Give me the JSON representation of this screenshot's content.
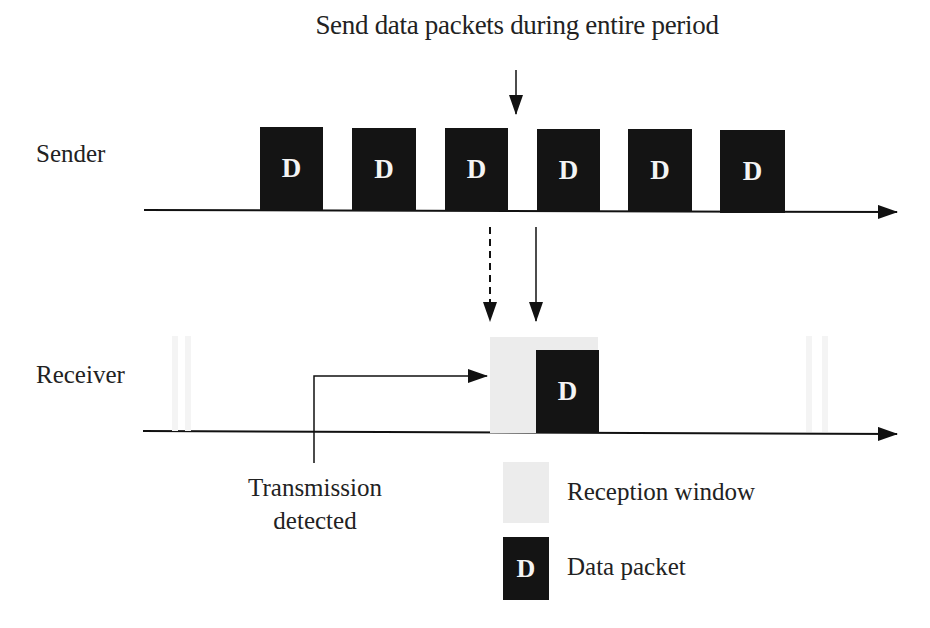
{
  "title": "Send data packets during entire period",
  "lanes": {
    "sender": {
      "label": "Sender"
    },
    "receiver": {
      "label": "Receiver"
    }
  },
  "packet_glyph": "D",
  "sender_packets": [
    {
      "label": "D"
    },
    {
      "label": "D"
    },
    {
      "label": "D"
    },
    {
      "label": "D"
    },
    {
      "label": "D"
    },
    {
      "label": "D"
    }
  ],
  "receiver_packet": {
    "label": "D"
  },
  "annotations": {
    "transmission_detected_line1": "Transmission",
    "transmission_detected_line2": "detected"
  },
  "legend": [
    {
      "symbol": "reception-window",
      "label": "Reception window",
      "color": "#ececec"
    },
    {
      "symbol": "data-packet",
      "glyph": "D",
      "label": "Data packet",
      "color": "#141414"
    }
  ]
}
